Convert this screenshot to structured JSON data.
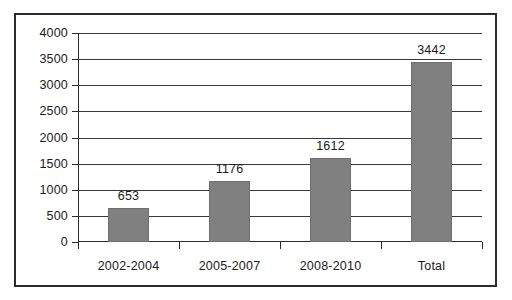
{
  "chart_data": {
    "type": "bar",
    "title": "",
    "subtitle": "",
    "xlabel": "",
    "ylabel": "",
    "categories": [
      "2002-2004",
      "2005-2007",
      "2008-2010",
      "Total"
    ],
    "values": [
      653,
      1176,
      1612,
      3442
    ],
    "data_labels": [
      "653",
      "1176",
      "1612",
      "3442"
    ],
    "ylim": [
      0,
      4000
    ],
    "ytick_labels": [
      "4000",
      "3500",
      "3000",
      "2500",
      "2000",
      "1500",
      "1000",
      "500",
      "0"
    ],
    "ytick_values": [
      4000,
      3500,
      3000,
      2500,
      2000,
      1500,
      1000,
      500,
      0
    ],
    "grid": true,
    "grid_axis": "y",
    "legend": false,
    "legend_position": "none",
    "series": [
      {
        "name": "",
        "values": [
          653,
          1176,
          1612,
          3442
        ]
      }
    ],
    "colors": {
      "bar_fill": "#808080",
      "bar_stroke": "#6f6f6f",
      "gridline": "#3a3a3a",
      "axis": "#2b2b2b",
      "frame_border": "#2b2b2b",
      "text": "#1a1a1a",
      "plot_background": "#ffffff",
      "page_background": "#ffffff"
    }
  }
}
